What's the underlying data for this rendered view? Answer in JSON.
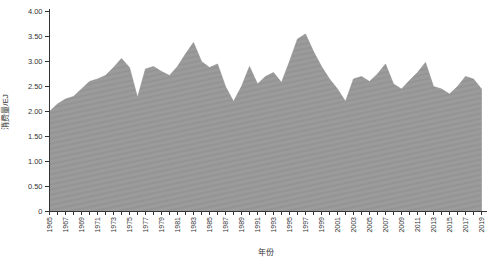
{
  "figure": {
    "background": "#ffffff",
    "axis_color": "#333333",
    "text_color": "#333333",
    "area_fill": "#9b9b9b",
    "area_fill_stripe": "#949494",
    "area_stroke": "#8d8d8d"
  },
  "chart_data": {
    "type": "area",
    "title": "",
    "xlabel": "年份",
    "ylabel": "消费量/EJ",
    "x": [
      1965,
      1966,
      1967,
      1968,
      1969,
      1970,
      1971,
      1972,
      1973,
      1974,
      1975,
      1976,
      1977,
      1978,
      1979,
      1980,
      1981,
      1982,
      1983,
      1984,
      1985,
      1986,
      1987,
      1988,
      1989,
      1990,
      1991,
      1992,
      1993,
      1994,
      1995,
      1996,
      1997,
      1998,
      1999,
      2000,
      2001,
      2002,
      2003,
      2004,
      2005,
      2006,
      2007,
      2008,
      2009,
      2010,
      2011,
      2012,
      2013,
      2014,
      2015,
      2016,
      2017,
      2018,
      2019
    ],
    "values": [
      2.0,
      2.15,
      2.25,
      2.3,
      2.45,
      2.6,
      2.65,
      2.72,
      2.88,
      3.06,
      2.88,
      2.28,
      2.85,
      2.9,
      2.8,
      2.72,
      2.9,
      3.15,
      3.38,
      3.0,
      2.88,
      2.95,
      2.5,
      2.2,
      2.5,
      2.9,
      2.55,
      2.7,
      2.78,
      2.58,
      3.0,
      3.45,
      3.55,
      3.2,
      2.9,
      2.65,
      2.45,
      2.2,
      2.65,
      2.7,
      2.6,
      2.75,
      2.95,
      2.55,
      2.45,
      2.62,
      2.78,
      2.98,
      2.5,
      2.45,
      2.35,
      2.5,
      2.7,
      2.65,
      2.45
    ],
    "series_name": "消费量",
    "ylim": [
      0,
      4.0
    ],
    "ytick_step": 0.5,
    "ytick_labels": [
      "0",
      "0.50",
      "1.00",
      "1.50",
      "2.00",
      "2.50",
      "3.00",
      "3.50",
      "4.00"
    ],
    "xtick_labels": [
      "1965",
      "1967",
      "1969",
      "1971",
      "1973",
      "1975",
      "1977",
      "1979",
      "1981",
      "1983",
      "1985",
      "1987",
      "1989",
      "1991",
      "1993",
      "1995",
      "1997",
      "1999",
      "2001",
      "2003",
      "2005",
      "2007",
      "2009",
      "2011",
      "2013",
      "2015",
      "2017",
      "2019"
    ],
    "xtick_label_every": 2,
    "grid": false,
    "legend": "none"
  }
}
